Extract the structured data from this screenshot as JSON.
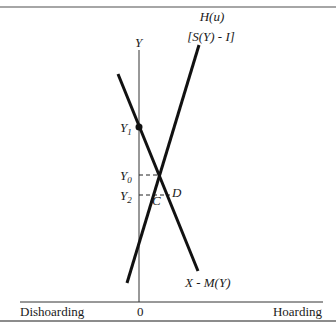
{
  "diagram": {
    "y_axis_label": "Y",
    "origin_label": "0",
    "x_axis_left_label": "Dishoarding",
    "x_axis_right_label": "Hoarding",
    "curve_up": {
      "label_line1": "H(u)",
      "label_line2": "[S(Y) - I]"
    },
    "curve_down": {
      "label": "X - M(Y)"
    },
    "levels": {
      "y1": "Y",
      "y1_sub": "1",
      "y0": "Y",
      "y0_sub": "0",
      "y2": "Y",
      "y2_sub": "2"
    },
    "points": {
      "c": "C",
      "d": "D"
    }
  }
}
